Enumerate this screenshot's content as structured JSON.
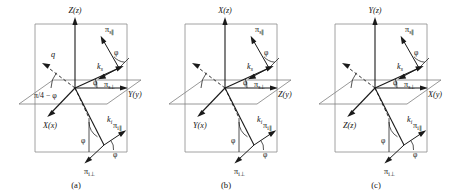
{
  "figure": {
    "panel_count": 3,
    "background_color": "#ffffff",
    "line_color": "#1a1a1a",
    "frame_color": "#8a8a8a"
  },
  "common": {
    "k_s": "k",
    "k_s_sub": "s",
    "k_i": "k",
    "k_i_sub": "i",
    "pi_s_par": "π",
    "pi_s_par_sub": "s∥",
    "pi_s_perp": "π",
    "pi_s_perp_sub": "s⊥",
    "pi_i_par": "π",
    "pi_i_par_sub": "i∥",
    "pi_i_perp": "π",
    "pi_i_perp_sub": "i⊥",
    "angle": "φ"
  },
  "panels": [
    {
      "id": "a",
      "caption": "(a)",
      "axis_vertical": "Z(z)",
      "axis_right": "Y(y)",
      "axis_left": "X(x)",
      "q_label": "q",
      "pi4_label": "π/4 − φ",
      "has_q_label": true,
      "has_pi4_label": true,
      "angles": [
        "φ",
        "φ",
        "φ",
        "φ"
      ]
    },
    {
      "id": "b",
      "caption": "(b)",
      "axis_vertical": "X(z)",
      "axis_right": "Z(y)",
      "axis_left": "Y(x)",
      "q_label": "",
      "pi4_label": "",
      "has_q_label": false,
      "has_pi4_label": false,
      "angles": [
        "φ",
        "φ",
        "φ",
        "φ"
      ]
    },
    {
      "id": "c",
      "caption": "(c)",
      "axis_vertical": "Y(z)",
      "axis_right": "X(y)",
      "axis_left": "Z(z)",
      "q_label": "",
      "pi4_label": "",
      "has_q_label": false,
      "has_pi4_label": false,
      "angles": [
        "φ",
        "φ",
        "φ",
        "φ"
      ]
    }
  ]
}
